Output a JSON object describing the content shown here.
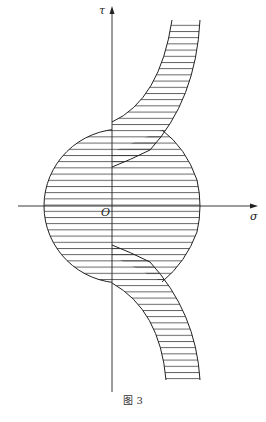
{
  "figure": {
    "caption": "图 3",
    "axes": {
      "x_label": "σ",
      "y_label": "τ",
      "origin_label": "O"
    },
    "colors": {
      "stroke": "#222222",
      "hatch": "#333333",
      "background": "#ffffff"
    }
  }
}
